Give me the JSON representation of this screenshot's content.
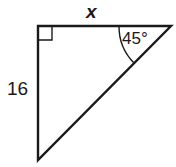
{
  "figure": {
    "type": "right-triangle-diagram",
    "background_color": "#ffffff",
    "stroke_color": "#1a1a1a",
    "stroke_width": 2.4,
    "vertices": {
      "top_left": {
        "x": 38,
        "y": 26
      },
      "top_right": {
        "x": 171,
        "y": 26
      },
      "bottom_left": {
        "x": 38,
        "y": 160
      }
    },
    "right_angle_marker": {
      "name": "right-angle-square",
      "x": 39,
      "y": 27,
      "size": 13,
      "stroke_width": 1.4
    },
    "angle_arc": {
      "name": "angle-arc-45",
      "center_x": 171,
      "center_y": 26,
      "radius": 52,
      "start": {
        "x": 119,
        "y": 26
      },
      "end": {
        "x": 134,
        "y": 63
      },
      "stroke_width": 1.4
    },
    "labels": {
      "top_side": "x",
      "left_side": "16",
      "angle": "45°"
    }
  }
}
